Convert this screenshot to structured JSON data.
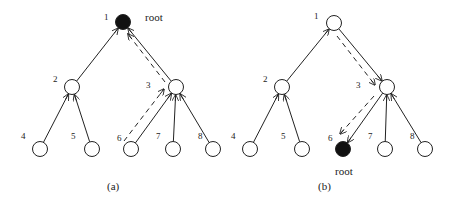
{
  "diagrams": [
    {
      "id": "a",
      "caption": "(a)",
      "caption_pos": [
        107,
        190
      ],
      "root_label": "root",
      "root_label_pos": [
        145,
        21
      ],
      "nodes": [
        {
          "id": "1",
          "label": "1",
          "x": 123,
          "y": 22,
          "filled": true,
          "lx": 104,
          "ly": 20
        },
        {
          "id": "2",
          "label": "2",
          "x": 72,
          "y": 87,
          "filled": false,
          "lx": 53,
          "ly": 82
        },
        {
          "id": "3",
          "label": "3",
          "x": 176,
          "y": 87,
          "filled": false,
          "lx": 146,
          "ly": 88
        },
        {
          "id": "4",
          "label": "4",
          "x": 40,
          "y": 149,
          "filled": false,
          "lx": 21,
          "ly": 139
        },
        {
          "id": "5",
          "label": "5",
          "x": 92,
          "y": 149,
          "filled": false,
          "lx": 71,
          "ly": 139
        },
        {
          "id": "6",
          "label": "6",
          "x": 131,
          "y": 149,
          "filled": false,
          "lx": 117,
          "ly": 141
        },
        {
          "id": "7",
          "label": "7",
          "x": 173,
          "y": 149,
          "filled": false,
          "lx": 156,
          "ly": 139
        },
        {
          "id": "8",
          "label": "8",
          "x": 213,
          "y": 149,
          "filled": false,
          "lx": 198,
          "ly": 139
        }
      ],
      "edges": [
        {
          "from": "2",
          "to": "1",
          "style": "solid"
        },
        {
          "from": "3",
          "to": "1",
          "style": "solid"
        },
        {
          "from": "4",
          "to": "2",
          "style": "solid"
        },
        {
          "from": "5",
          "to": "2",
          "style": "solid"
        },
        {
          "from": "6",
          "to": "3",
          "style": "solid"
        },
        {
          "from": "7",
          "to": "3",
          "style": "solid"
        },
        {
          "from": "8",
          "to": "3",
          "style": "solid"
        }
      ],
      "dashed_paths": [
        {
          "x1": 124,
          "y1": 141,
          "x2": 164,
          "y2": 89,
          "arrow": true
        },
        {
          "x1": 165,
          "y1": 82,
          "x2": 128,
          "y2": 34,
          "arrow": true
        }
      ]
    },
    {
      "id": "b",
      "caption": "(b)",
      "caption_pos": [
        318,
        190
      ],
      "root_label": "root",
      "root_label_pos": [
        335,
        175
      ],
      "nodes": [
        {
          "id": "1",
          "label": "1",
          "x": 334,
          "y": 23,
          "filled": false,
          "lx": 314,
          "ly": 19
        },
        {
          "id": "2",
          "label": "2",
          "x": 282,
          "y": 87,
          "filled": false,
          "lx": 263,
          "ly": 82
        },
        {
          "id": "3",
          "label": "3",
          "x": 387,
          "y": 87,
          "filled": false,
          "lx": 356,
          "ly": 88
        },
        {
          "id": "4",
          "label": "4",
          "x": 250,
          "y": 149,
          "filled": false,
          "lx": 231,
          "ly": 139
        },
        {
          "id": "5",
          "label": "5",
          "x": 302,
          "y": 149,
          "filled": false,
          "lx": 281,
          "ly": 139
        },
        {
          "id": "6",
          "label": "6",
          "x": 343,
          "y": 149,
          "filled": true,
          "lx": 328,
          "ly": 141
        },
        {
          "id": "7",
          "label": "7",
          "x": 385,
          "y": 149,
          "filled": false,
          "lx": 368,
          "ly": 139
        },
        {
          "id": "8",
          "label": "8",
          "x": 425,
          "y": 149,
          "filled": false,
          "lx": 410,
          "ly": 139
        }
      ],
      "edges": [
        {
          "from": "2",
          "to": "1",
          "style": "solid"
        },
        {
          "from": "1",
          "to": "3",
          "style": "solid"
        },
        {
          "from": "4",
          "to": "2",
          "style": "solid"
        },
        {
          "from": "5",
          "to": "2",
          "style": "solid"
        },
        {
          "from": "3",
          "to": "6",
          "style": "solid"
        },
        {
          "from": "7",
          "to": "3",
          "style": "solid"
        },
        {
          "from": "8",
          "to": "3",
          "style": "solid"
        }
      ],
      "dashed_paths": [
        {
          "x1": 337,
          "y1": 36,
          "x2": 375,
          "y2": 85,
          "arrow": true
        },
        {
          "x1": 374,
          "y1": 96,
          "x2": 340,
          "y2": 134,
          "arrow": true
        }
      ]
    }
  ],
  "node_radius": 7.5
}
